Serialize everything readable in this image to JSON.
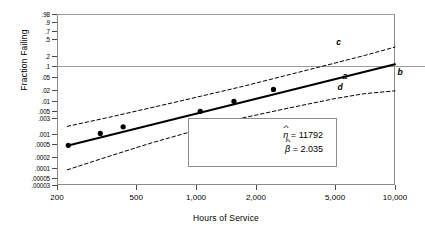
{
  "chart_data": {
    "type": "line",
    "title": "",
    "xlabel": "Hours of Service",
    "ylabel": "Fraction Failing",
    "xscale": "log",
    "yscale": "weibull-probability",
    "xlim": [
      200,
      10000
    ],
    "ylim": [
      3e-05,
      0.98
    ],
    "grid": false,
    "legend": "inline-curve-labels",
    "xticks": [
      {
        "value": 200,
        "label": "200"
      },
      {
        "value": 500,
        "label": "500"
      },
      {
        "value": 1000,
        "label": "1,000"
      },
      {
        "value": 2000,
        "label": "2,000"
      },
      {
        "value": 5000,
        "label": "5,000"
      },
      {
        "value": 10000,
        "label": "10,000"
      }
    ],
    "yticks": [
      {
        "value": 0.98,
        "label": ".98"
      },
      {
        "value": 0.9,
        "label": ".9"
      },
      {
        "value": 0.7,
        "label": ".7"
      },
      {
        "value": 0.5,
        "label": ".5"
      },
      {
        "value": 0.2,
        "label": ".2"
      },
      {
        "value": 0.1,
        "label": ".1"
      },
      {
        "value": 0.05,
        "label": ".05"
      },
      {
        "value": 0.02,
        "label": ".02"
      },
      {
        "value": 0.01,
        "label": ".01"
      },
      {
        "value": 0.005,
        "label": ".005"
      },
      {
        "value": 0.003,
        "label": ".003"
      },
      {
        "value": 0.001,
        "label": ".001"
      },
      {
        "value": 0.0005,
        "label": ".0005"
      },
      {
        "value": 0.0002,
        "label": ".0002"
      },
      {
        "value": 0.0001,
        "label": ".0001"
      },
      {
        "value": 5e-05,
        "label": ".00005"
      },
      {
        "value": 3e-05,
        "label": ".00003"
      }
    ],
    "reference_lines": [
      {
        "orientation": "horizontal",
        "value": 0.1
      },
      {
        "orientation": "horizontal",
        "value": 0.98
      }
    ],
    "series": [
      {
        "name": "a",
        "role": "weibull-fit-line",
        "style": "solid",
        "points": [
          {
            "x": 225,
            "y": 0.00045
          },
          {
            "x": 10000,
            "y": 0.115
          }
        ]
      },
      {
        "name": "c",
        "role": "upper-confidence-bound",
        "style": "dashed",
        "points": [
          {
            "x": 225,
            "y": 0.0017
          },
          {
            "x": 350,
            "y": 0.003
          },
          {
            "x": 600,
            "y": 0.0062
          },
          {
            "x": 1000,
            "y": 0.0125
          },
          {
            "x": 1700,
            "y": 0.026
          },
          {
            "x": 3000,
            "y": 0.06
          },
          {
            "x": 5000,
            "y": 0.125
          },
          {
            "x": 7000,
            "y": 0.2
          },
          {
            "x": 10000,
            "y": 0.33
          }
        ]
      },
      {
        "name": "d",
        "role": "lower-confidence-bound",
        "style": "dashed",
        "points": [
          {
            "x": 225,
            "y": 8.5e-05
          },
          {
            "x": 350,
            "y": 0.0002
          },
          {
            "x": 600,
            "y": 0.00055
          },
          {
            "x": 1000,
            "y": 0.0013
          },
          {
            "x": 1700,
            "y": 0.003
          },
          {
            "x": 3000,
            "y": 0.0062
          },
          {
            "x": 5000,
            "y": 0.0115
          },
          {
            "x": 7000,
            "y": 0.016
          },
          {
            "x": 10000,
            "y": 0.0195
          }
        ]
      },
      {
        "name": "observations",
        "role": "plotted-failure-points",
        "style": "markers",
        "points": [
          {
            "x": 228,
            "y": 0.00046
          },
          {
            "x": 330,
            "y": 0.00105
          },
          {
            "x": 430,
            "y": 0.00165
          },
          {
            "x": 1050,
            "y": 0.0048
          },
          {
            "x": 1550,
            "y": 0.0095
          },
          {
            "x": 2450,
            "y": 0.0215
          }
        ]
      }
    ],
    "curve_labels": [
      {
        "text": "a",
        "x": 5600,
        "y": 0.052
      },
      {
        "text": "b",
        "x": 10600,
        "y": 0.068
      },
      {
        "text": "c",
        "x": 5200,
        "y": 0.43
      },
      {
        "text": "d",
        "x": 5300,
        "y": 0.0255
      }
    ],
    "annotations": {
      "eta_symbol": "η",
      "eta_equals": "=",
      "eta_value": "11792",
      "beta_symbol": "β",
      "beta_equals": "=",
      "beta_value": "2.035"
    }
  },
  "colors": {
    "frame": "#8a8a8a",
    "reference": "#9a9a9a",
    "fit_line": "#000000",
    "bounds": "#000000",
    "markers": "#000000"
  }
}
